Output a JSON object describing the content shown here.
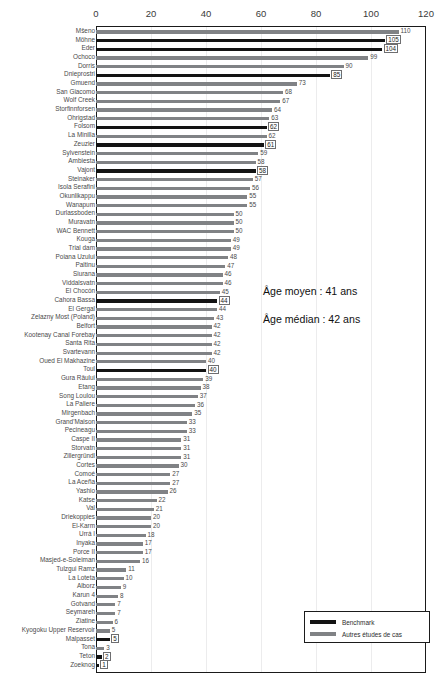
{
  "chart_data": {
    "type": "bar",
    "orientation": "horizontal",
    "title": "",
    "xlabel": "",
    "ylabel": "",
    "xlim": [
      0,
      120
    ],
    "xticks": [
      0,
      20,
      40,
      60,
      80,
      100,
      120
    ],
    "grid": true,
    "legend_position": "bottom-right",
    "series": [
      {
        "name": "Benchmark",
        "color": "#131313"
      },
      {
        "name": "Autres études de cas",
        "color": "#808285"
      }
    ],
    "categories": [
      "Mšeno",
      "Möhne",
      "Eder",
      "Ochoco",
      "Dorris",
      "Dnieprostri",
      "Gmuend",
      "San Giacomo",
      "Wolf Creek",
      "Storfinnforsen",
      "Ohrigstad",
      "Folsom",
      "La Minilla",
      "Zeuzier",
      "Sylvenstein",
      "Ambiesta",
      "Vajont",
      "Steinaker",
      "Isola Serafini",
      "Okunlikappu",
      "Wanapum",
      "Durlassboden",
      "Muravatn",
      "WAC Bennett",
      "Kouga",
      "Trial dam",
      "Poiana Uzului",
      "Paltinu",
      "Siurana",
      "Viddalsvatn",
      "El Chocón",
      "Cahora Bassa",
      "El Gergal",
      "Zelazny Most (Poland)",
      "Belfort",
      "Kootenay Canal Forebay",
      "Santa Rita",
      "Svartevann",
      "Oued El Makhazine",
      "Toul",
      "Gura Râului",
      "Etang",
      "Song Loulou",
      "La Paliere",
      "Mirgenbach",
      "Grand'Maison",
      "Pecineagu",
      "Caspe II",
      "Storvatn",
      "Zillergründl",
      "Cortes",
      "Comoé",
      "La Aceña",
      "Yashio",
      "Katse",
      "Val",
      "Driekoppies",
      "El-Karm",
      "Urrá I",
      "Inyaka",
      "Porce II",
      "Masjed-e-Soleiman",
      "Tulzgui Ramz",
      "La Loteta",
      "Alborz",
      "Karun 4",
      "Gotvand",
      "Seymareh",
      "Ziatine",
      "Kyogoku Upper Reservoir",
      "Malpasset",
      "Tona",
      "Teton",
      "Zoeknog"
    ],
    "values": [
      110,
      105,
      104,
      99,
      90,
      85,
      73,
      68,
      67,
      64,
      63,
      62,
      62,
      61,
      59,
      58,
      58,
      57,
      56,
      55,
      55,
      50,
      50,
      50,
      49,
      49,
      48,
      47,
      46,
      46,
      45,
      44,
      44,
      43,
      42,
      42,
      42,
      42,
      40,
      40,
      39,
      38,
      37,
      36,
      35,
      33,
      33,
      31,
      31,
      31,
      30,
      27,
      27,
      26,
      22,
      21,
      20,
      20,
      18,
      17,
      17,
      16,
      11,
      10,
      9,
      8,
      7,
      7,
      6,
      5,
      5,
      3,
      2,
      1
    ],
    "benchmark_flags": [
      false,
      true,
      true,
      false,
      false,
      true,
      false,
      false,
      false,
      false,
      false,
      true,
      false,
      true,
      false,
      false,
      true,
      false,
      false,
      false,
      false,
      false,
      false,
      false,
      false,
      false,
      false,
      false,
      false,
      false,
      false,
      true,
      false,
      false,
      false,
      false,
      false,
      false,
      false,
      true,
      false,
      false,
      false,
      false,
      false,
      false,
      false,
      false,
      false,
      false,
      false,
      false,
      false,
      false,
      false,
      false,
      false,
      false,
      false,
      false,
      false,
      false,
      false,
      false,
      false,
      false,
      false,
      false,
      false,
      false,
      true,
      false,
      true,
      true
    ],
    "annotations": [
      {
        "id": "mean",
        "text": "Âge moyen  : 41 ans"
      },
      {
        "id": "median",
        "text": "Âge médian  : 42 ans"
      }
    ]
  }
}
